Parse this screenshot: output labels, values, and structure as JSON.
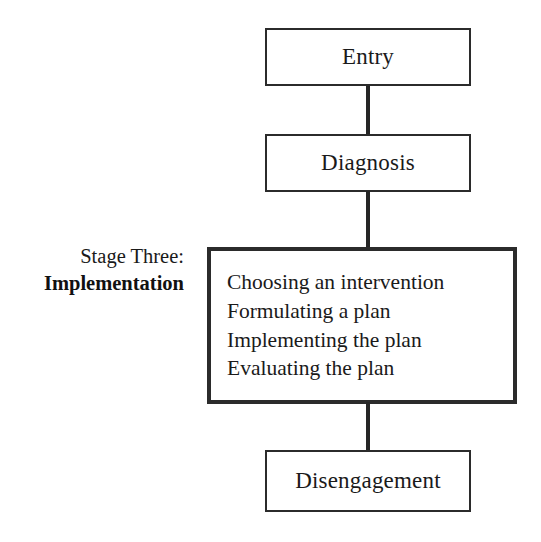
{
  "diagram": {
    "title": "Stage Three: Implementation",
    "background_color": "#ffffff",
    "line_color": "#262626",
    "text_color": "#1a1a1a",
    "caption": {
      "line1": "Stage Three:",
      "line2": "Implementation"
    },
    "nodes": [
      {
        "id": "entry",
        "label": "Entry"
      },
      {
        "id": "diagnosis",
        "label": "Diagnosis"
      },
      {
        "id": "implementation",
        "label": "Implementation activities"
      },
      {
        "id": "disengagement",
        "label": "Disengagement"
      }
    ],
    "implementation_steps": [
      "Choosing an intervention",
      "Formulating a plan",
      "Implementing the plan",
      "Evaluating the plan"
    ]
  }
}
